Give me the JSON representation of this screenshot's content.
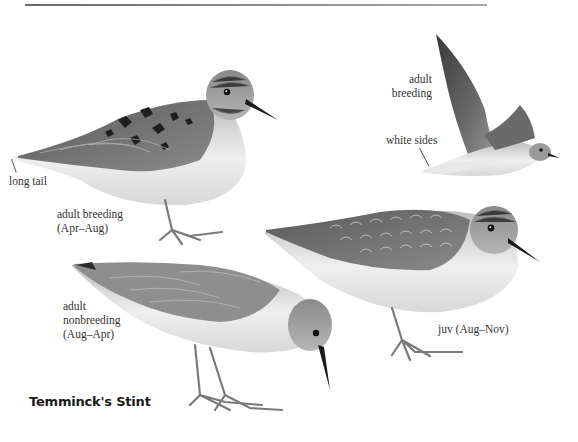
{
  "plate": {
    "species_title": "Temminck's Stint",
    "palette": {
      "ink": "#1a1a1a",
      "label_text": "#333333",
      "rule": "#7a7a7a",
      "background": "#ffffff"
    }
  },
  "figures": [
    {
      "id": "adult-breeding-standing",
      "labels": [
        "adult breeding",
        "(Apr–Aug)"
      ],
      "callouts": [
        {
          "text": "long tail"
        }
      ]
    },
    {
      "id": "adult-breeding-flight",
      "labels": [
        "adult",
        "breeding"
      ],
      "callouts": [
        {
          "text": "white sides"
        }
      ]
    },
    {
      "id": "adult-nonbreeding",
      "labels": [
        "adult",
        "nonbreeding",
        "(Aug–Apr)"
      ]
    },
    {
      "id": "juvenile",
      "labels": [
        "juv (Aug–Nov)"
      ]
    }
  ]
}
